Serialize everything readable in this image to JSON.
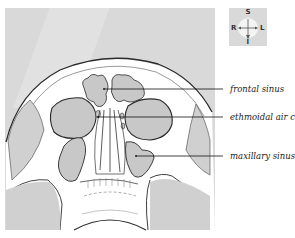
{
  "figure": {
    "type": "anatomical-illustration"
  },
  "orientation_compass": {
    "top": "S",
    "bottom": "I",
    "left": "R",
    "right": "L"
  },
  "labels": [
    {
      "text": "frontal sinus",
      "y": 89
    },
    {
      "text": "ethmoidal air cell",
      "y": 117
    },
    {
      "text": "maxillary sinus",
      "y": 156
    }
  ],
  "colors": {
    "background_panel": "#d9d9d9",
    "bone": "#ffffff",
    "sinus_fill": "#c8c8c8",
    "outline": "#2a2a2a"
  }
}
